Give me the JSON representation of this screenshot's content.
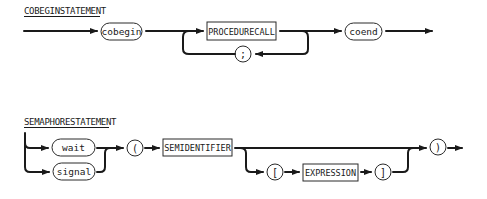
{
  "diagrams": [
    {
      "title": "COBEGINSTATEMENT",
      "nodes": {
        "cobegin": {
          "label": "cobegin",
          "kind": "terminal"
        },
        "procedurecall": {
          "label": "PROCEDURECALL",
          "kind": "nonterminal"
        },
        "semicolon": {
          "label": ";",
          "kind": "terminal"
        },
        "coend": {
          "label": "coend",
          "kind": "terminal"
        }
      }
    },
    {
      "title": "SEMAPHORESTATEMENT",
      "nodes": {
        "wait": {
          "label": "wait",
          "kind": "terminal"
        },
        "signal": {
          "label": "signal",
          "kind": "terminal"
        },
        "lparen": {
          "label": "(",
          "kind": "terminal"
        },
        "semidentifier": {
          "label": "SEMIDENTIFIER",
          "kind": "nonterminal"
        },
        "lbracket": {
          "label": "[",
          "kind": "terminal"
        },
        "expression": {
          "label": "EXPRESSION",
          "kind": "nonterminal"
        },
        "rbracket": {
          "label": "]",
          "kind": "terminal"
        },
        "rparen": {
          "label": ")",
          "kind": "terminal"
        }
      }
    }
  ]
}
